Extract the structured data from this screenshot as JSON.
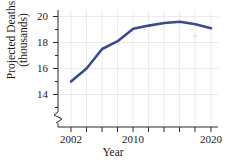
{
  "chart_data": {
    "type": "line",
    "title": "",
    "xlabel": "Year",
    "ylabel_line1": "Projected Deaths",
    "ylabel_line2": "(thousands)",
    "x": [
      2002,
      2004,
      2006,
      2008,
      2010,
      2012,
      2014,
      2016,
      2018,
      2020
    ],
    "values": [
      15.0,
      16.0,
      17.5,
      18.1,
      19.05,
      19.3,
      19.5,
      19.6,
      19.4,
      19.1
    ],
    "series": [
      {
        "name": "Projected Deaths",
        "values": [
          15.0,
          16.0,
          17.5,
          18.1,
          19.05,
          19.3,
          19.5,
          19.6,
          19.4,
          19.1
        ],
        "color": "#3b4a8c"
      }
    ],
    "xlim": [
      2001,
      2021
    ],
    "ylim": [
      13.0,
      20.2
    ],
    "xticks": [
      2002,
      2004,
      2006,
      2008,
      2010,
      2012,
      2014,
      2016,
      2018,
      2020
    ],
    "xtick_labels": [
      "2002",
      "",
      "",
      "",
      "2010",
      "",
      "",
      "",
      "",
      "2020"
    ],
    "yticks": [
      14,
      16,
      18,
      20
    ],
    "ytick_labels": [
      "14",
      "16",
      "18",
      "20"
    ],
    "y_minor_step": 0.5,
    "grid": true,
    "grid_color": "#e3e3e8",
    "legend": "none",
    "axis_break": true,
    "line_color": "#3b4a8c",
    "line_width": 2.6,
    "background": "#ffffff",
    "artifact_mark": "‹›"
  }
}
